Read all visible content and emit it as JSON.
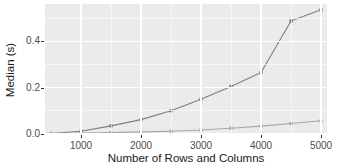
{
  "chart_data": {
    "type": "line",
    "title": "",
    "xlabel": "Number of Rows and Columns",
    "ylabel": "Median (s)",
    "xlim": [
      400,
      5100
    ],
    "ylim": [
      0.0,
      0.56
    ],
    "grid": true,
    "legend": "none",
    "x": [
      500,
      1000,
      1500,
      2000,
      2500,
      3000,
      3500,
      4000,
      4500,
      5000
    ],
    "xticks": [
      1000,
      2000,
      3000,
      4000,
      5000
    ],
    "xtick_labels": [
      "1000",
      "2000",
      "3000",
      "4000",
      "5000"
    ],
    "xticks_minor": [
      1500,
      2500,
      3500,
      4500
    ],
    "yticks": [
      0.0,
      0.2,
      0.4
    ],
    "ytick_labels": [
      "0.0",
      "0.2",
      "0.4"
    ],
    "yticks_minor": [
      0.1,
      0.3,
      0.5
    ],
    "series": [
      {
        "name": "upper",
        "color": "#7f7f7f",
        "marker": "square",
        "values": [
          0.002,
          0.012,
          0.035,
          0.062,
          0.1,
          0.15,
          0.205,
          0.265,
          0.487,
          0.535
        ]
      },
      {
        "name": "lower",
        "color": "#a6a6a6",
        "marker": "square",
        "values": [
          0.002,
          0.004,
          0.006,
          0.009,
          0.012,
          0.017,
          0.025,
          0.034,
          0.045,
          0.057
        ]
      }
    ]
  },
  "axis": {
    "ylabel": "Median (s)",
    "xlabel": "Number of Rows and Columns",
    "ytick_labels": [
      "0.0",
      "0.2",
      "0.4"
    ],
    "xtick_labels": [
      "1000",
      "2000",
      "3000",
      "4000",
      "5000"
    ]
  },
  "colors": {
    "panel_background": "#ebebeb",
    "gridline": "#ffffff",
    "series_upper": "#7f7f7f",
    "series_lower": "#a6a6a6",
    "tick_text": "#4d4d4d",
    "axis_title": "#1a1a1a",
    "figure_background": "#ffffff"
  }
}
